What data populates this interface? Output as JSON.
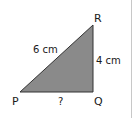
{
  "diagram": {
    "type": "right-triangle",
    "vertices": {
      "P": "P",
      "Q": "Q",
      "R": "R"
    },
    "sides": {
      "PR": "6 cm",
      "QR": "4 cm",
      "PQ": "?"
    },
    "fill_color": "#8a8a8a",
    "stroke_color": "#333333"
  }
}
